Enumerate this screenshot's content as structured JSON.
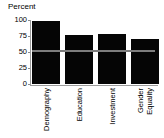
{
  "chart_data": {
    "type": "bar",
    "title": "",
    "subtitle": "",
    "xlabel": "",
    "ylabel": "Percent",
    "categories": [
      "Demography",
      "Education",
      "Investment",
      "Gender Equality"
    ],
    "values": [
      98,
      76,
      78,
      70
    ],
    "ylim": [
      0,
      100
    ],
    "yticks": [
      0,
      25,
      50,
      75,
      100
    ],
    "ytick_labels": [
      "0",
      "25",
      "50",
      "75",
      "100"
    ],
    "grid": false,
    "legend": "none",
    "bar_color": "#050505",
    "reference_line": {
      "value": 50,
      "color": "#7d7d7d",
      "orientation": "horizontal"
    },
    "annotations": []
  },
  "axis": {
    "y_title": "Percent",
    "ticks": [
      {
        "label": "100",
        "value": 100
      },
      {
        "label": "75",
        "value": 75
      },
      {
        "label": "50",
        "value": 50
      },
      {
        "label": "25",
        "value": 25
      },
      {
        "label": "0",
        "value": 0
      }
    ]
  },
  "categories": [
    {
      "line1": "Demography",
      "line2": ""
    },
    {
      "line1": "Education",
      "line2": ""
    },
    {
      "line1": "Investment",
      "line2": ""
    },
    {
      "line1": "Gender",
      "line2": "Equality"
    }
  ]
}
